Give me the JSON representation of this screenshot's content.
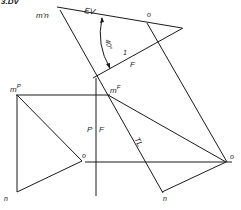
{
  "figure": {
    "title_partial": "3.DV",
    "labels": {
      "m_prime_n": "m'n",
      "ev": "EV",
      "o_top": "o",
      "angle": "40°",
      "fold_1": "1",
      "fold_f_top": "F",
      "m_p": "mP",
      "m_p_base": "m",
      "m_p_sup": "P",
      "m_f_base": "m",
      "m_f_sup": "F",
      "fold_p": "P",
      "fold_f": "F",
      "o_left": "o",
      "tl": "TL",
      "o_right": "o",
      "n_left": "n",
      "n_right": "n"
    },
    "colors": {
      "line": "#1a1a1a",
      "background": "#ffffff"
    }
  }
}
